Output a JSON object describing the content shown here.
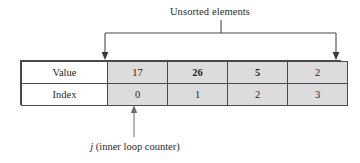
{
  "figure": {
    "top_annotation": "Unsorted elements",
    "bottom_annotation_symbol": "j",
    "bottom_annotation_text": " (inner loop counter)"
  },
  "table": {
    "row_labels": [
      "Value",
      "Index"
    ],
    "values": [
      "17",
      "26",
      "5",
      "2"
    ],
    "indices": [
      "0",
      "1",
      "2",
      "3"
    ],
    "bold_values": [
      false,
      true,
      true,
      false
    ],
    "bold_indices": [
      false,
      false,
      false,
      false
    ]
  },
  "colors": {
    "cell_fill": "#dcdcdc",
    "label_fill": "#ffffff",
    "line": "#4a4a4a",
    "text": "#1f1f1f",
    "background": "#ffffff"
  },
  "annotations": {
    "bracket_left_arrow_target": "value-cell-0",
    "bracket_right_arrow_target": "value-cell-3",
    "pointer_arrow_target": "index-cell-1"
  }
}
